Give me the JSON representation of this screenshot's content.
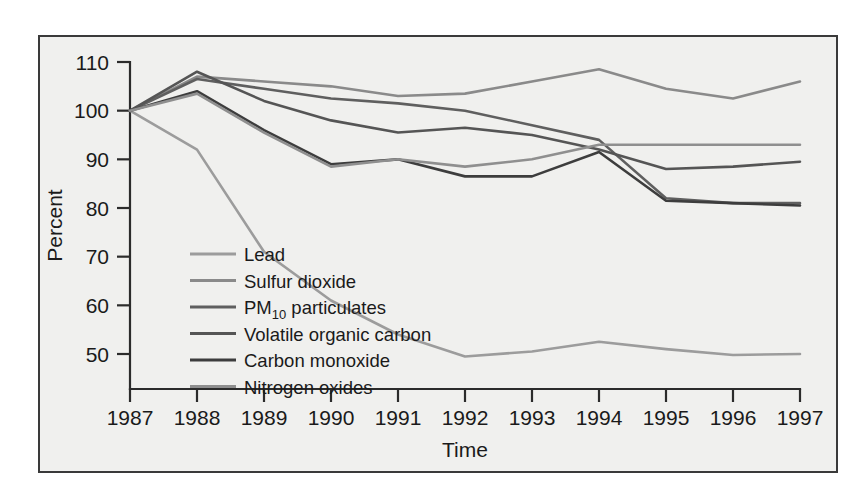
{
  "figure": {
    "background_color": "#ffffff",
    "panel_color": "#f0f0ee",
    "border_color": "#3a3a3a"
  },
  "chart_data": {
    "type": "line",
    "title": "",
    "xlabel": "Time",
    "ylabel": "Percent",
    "x": [
      1987,
      1988,
      1989,
      1990,
      1991,
      1992,
      1993,
      1994,
      1995,
      1996,
      1997
    ],
    "categories": [
      "1987",
      "1988",
      "1989",
      "1990",
      "1991",
      "1992",
      "1993",
      "1994",
      "1995",
      "1996",
      "1997"
    ],
    "xtick_labels": [
      "1987",
      "1988",
      "1989",
      "1990",
      "1991",
      "1992",
      "1993",
      "1994",
      "1995",
      "1996",
      "1997"
    ],
    "ytick_labels": [
      "50",
      "60",
      "70",
      "80",
      "90",
      "100",
      "110"
    ],
    "yticks": [
      50,
      60,
      70,
      80,
      90,
      100,
      110
    ],
    "ylim": [
      45,
      112
    ],
    "xlim": [
      1987,
      1997
    ],
    "grid": false,
    "legend_position": "inside-lower-left",
    "series": [
      {
        "name": "Lead",
        "color": "#9c9c9c",
        "values": [
          100,
          92,
          71,
          61,
          54,
          49.5,
          50.5,
          52.5,
          51,
          49.8,
          50
        ]
      },
      {
        "name": "Sulfur dioxide",
        "color": "#8a8a8a",
        "values": [
          100,
          107,
          106,
          105,
          103,
          103.5,
          106,
          108.5,
          104.5,
          102.5,
          106
        ]
      },
      {
        "name": "PM10 particulates",
        "color": "#5f5f5f",
        "values": [
          100,
          106.5,
          104.5,
          102.5,
          101.5,
          100,
          97,
          94,
          82,
          81,
          81
        ]
      },
      {
        "name": "Volatile organic carbon",
        "color": "#555555",
        "values": [
          100,
          108,
          102,
          98,
          95.5,
          96.5,
          95,
          92,
          88,
          88.5,
          89.5
        ]
      },
      {
        "name": "Carbon monoxide",
        "color": "#3d3d3d",
        "values": [
          100,
          104,
          96,
          89,
          90,
          86.5,
          86.5,
          91.5,
          81.5,
          81,
          80.5
        ]
      },
      {
        "name": "Nitrogen oxides",
        "color": "#8f8f8f",
        "values": [
          100,
          103.5,
          95.5,
          88.5,
          90,
          88.5,
          90,
          93,
          93,
          93,
          93
        ]
      }
    ],
    "legend_entries": [
      {
        "label": "Lead",
        "sub": "",
        "tail": "",
        "color": "#9c9c9c"
      },
      {
        "label": "Sulfur dioxide",
        "sub": "",
        "tail": "",
        "color": "#8a8a8a"
      },
      {
        "label": "PM",
        "sub": "10",
        "tail": " particulates",
        "color": "#5f5f5f"
      },
      {
        "label": "Volatile organic carbon",
        "sub": "",
        "tail": "",
        "color": "#555555"
      },
      {
        "label": "Carbon monoxide",
        "sub": "",
        "tail": "",
        "color": "#3d3d3d"
      },
      {
        "label": "Nitrogen oxides",
        "sub": "",
        "tail": "",
        "color": "#8f8f8f"
      }
    ]
  }
}
